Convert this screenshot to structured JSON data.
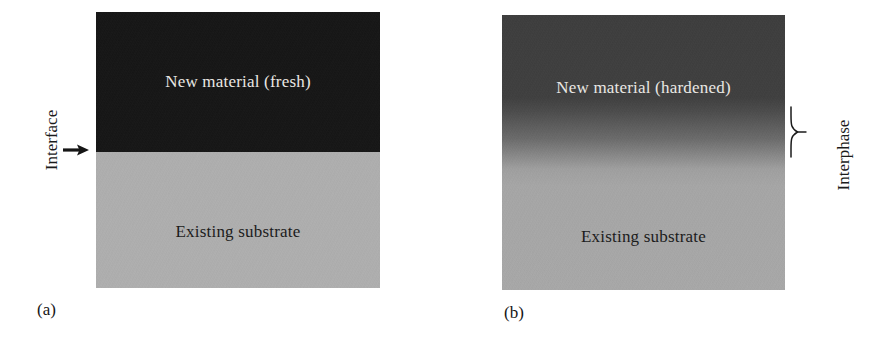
{
  "figure": {
    "type": "schematic-diagram",
    "background_color": "#ffffff",
    "panels": [
      {
        "id": "a",
        "caption": "(a)",
        "interface_type": "sharp",
        "regions": [
          {
            "name": "new-material",
            "label": "New material (fresh)",
            "fill_color": "#121212",
            "text_color": "#f2f0ec",
            "position": "top"
          },
          {
            "name": "existing-substrate",
            "label": "Existing substrate",
            "fill_color": "#b2b2b2",
            "text_color": "#161616",
            "position": "bottom"
          }
        ],
        "annotation": {
          "label": "Interface",
          "icon": "right-arrow-icon",
          "side": "left",
          "orientation": "vertical",
          "text_color": "#1b1b1b"
        }
      },
      {
        "id": "b",
        "caption": "(b)",
        "interface_type": "graded",
        "regions": [
          {
            "name": "new-material",
            "label": "New material (hardened)",
            "fill_color": "#3b3b3b",
            "text_color": "#f2f0ec",
            "position": "top"
          },
          {
            "name": "existing-substrate",
            "label": "Existing substrate",
            "fill_color": "#ababab",
            "text_color": "#161616",
            "position": "bottom"
          }
        ],
        "annotation": {
          "label": "Interphase",
          "icon": "curly-brace-icon",
          "side": "right",
          "orientation": "vertical",
          "text_color": "#1b1b1b"
        }
      }
    ]
  }
}
